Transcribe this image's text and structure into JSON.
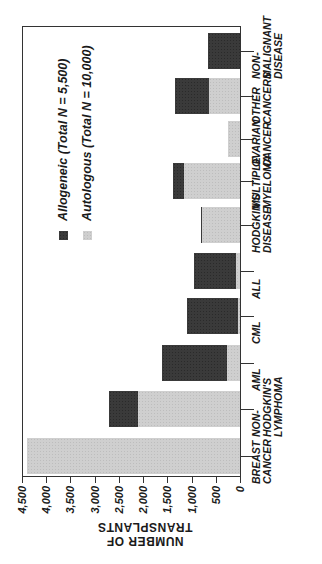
{
  "chart_data": {
    "type": "bar",
    "orientation": "stacked bar chart rendered rotated 90 degrees (value axis horizontal at bottom, reversed)",
    "title": "",
    "xlabel": "",
    "ylabel": "NUMBER OF TRANSPLANTS",
    "ylim": [
      0,
      4500
    ],
    "yticks": [
      "0",
      "500",
      "1,000",
      "1,500",
      "2,000",
      "2,500",
      "3,000",
      "3,500",
      "4,000",
      "4,500"
    ],
    "grid": false,
    "legend_position": "upper left (rotated)",
    "categories": [
      "BREAST CANCER",
      "NON-HODGKIN'S LYMPHOMA",
      "AML",
      "CML",
      "ALL",
      "HODGKIN'S DISEASE",
      "MULTIPLE MYELOMA",
      "OVARIAN CANCER",
      "OTHER CANCERS",
      "NON-MALIGNANT DISEASE"
    ],
    "series": [
      {
        "name": "Autologous (Total N = 10,000)",
        "color": "#cfcfcf",
        "values": [
          4400,
          2100,
          270,
          50,
          80,
          780,
          1150,
          250,
          650,
          0
        ]
      },
      {
        "name": "Allogeneic (Total N = 5,500)",
        "color": "#3a3a3a",
        "values": [
          0,
          600,
          1330,
          1050,
          870,
          20,
          230,
          0,
          700,
          660
        ]
      }
    ]
  },
  "legend": {
    "items": [
      {
        "label": "Allogeneic (Total N = 5,500)",
        "color": "#3a3a3a"
      },
      {
        "label": "Autologous (Total N = 10,000)",
        "color": "#cfcfcf"
      }
    ]
  },
  "axis": {
    "title": "NUMBER OF TRANSPLANTS",
    "ticks": [
      "0",
      "500",
      "1,000",
      "1,500",
      "2,000",
      "2,500",
      "3,000",
      "3,500",
      "4,000",
      "4,500"
    ]
  },
  "category_labels": [
    {
      "lines": [
        "BREAST",
        "CANCER"
      ]
    },
    {
      "lines": [
        "NON-",
        "HODGKIN'S",
        "LYMPHOMA"
      ]
    },
    {
      "lines": [
        "AML"
      ]
    },
    {
      "lines": [
        "CML"
      ]
    },
    {
      "lines": [
        "ALL"
      ]
    },
    {
      "lines": [
        "HODGKIN'S",
        "DISEASE"
      ]
    },
    {
      "lines": [
        "MULTIPLE",
        "MYELOMA"
      ]
    },
    {
      "lines": [
        "OVARIAN",
        "CANCER"
      ]
    },
    {
      "lines": [
        "OTHER",
        "CANCERS"
      ]
    },
    {
      "lines": [
        "NON-",
        "MALIGNANT",
        "DISEASE"
      ]
    }
  ]
}
